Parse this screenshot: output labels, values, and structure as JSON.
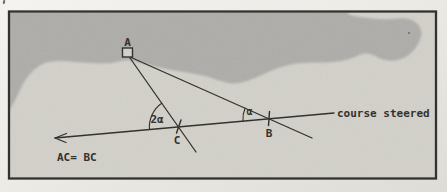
{
  "figure": {
    "colors": {
      "page": "#edebe6",
      "paper": "#d3d1ca",
      "sea": "#afada9",
      "ink": "#2d2b27",
      "frame": "#34322e"
    },
    "points": {
      "a": {
        "label": "A"
      },
      "b": {
        "label": "B"
      },
      "c": {
        "label": "C"
      }
    },
    "angles": {
      "at_c": "2α",
      "at_b": "α"
    },
    "annotations": {
      "course": "course steered",
      "equation": "AC= BC"
    }
  }
}
